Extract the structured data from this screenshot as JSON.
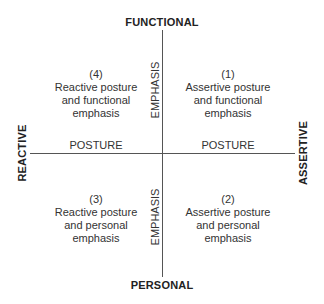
{
  "diagram": {
    "poles": {
      "top": "FUNCTIONAL",
      "bottom": "PERSONAL",
      "left": "REACTIVE",
      "right": "ASSERTIVE"
    },
    "axes": {
      "horizontal_label_left": "POSTURE",
      "horizontal_label_right": "POSTURE",
      "vertical_label_top": "EMPHASIS",
      "vertical_label_bottom": "EMPHASIS"
    },
    "quadrants": {
      "q1": {
        "number": "(1)",
        "line1": "Assertive posture",
        "line2": "and functional",
        "line3": "emphasis"
      },
      "q2": {
        "number": "(2)",
        "line1": "Assertive posture",
        "line2": "and personal",
        "line3": "emphasis"
      },
      "q3": {
        "number": "(3)",
        "line1": "Reactive posture",
        "line2": "and personal",
        "line3": "emphasis"
      },
      "q4": {
        "number": "(4)",
        "line1": "Reactive posture",
        "line2": "and functional",
        "line3": "emphasis"
      }
    },
    "colors": {
      "axis_line": "#555555",
      "pole_text": "#222222",
      "body_text": "#333333",
      "background": "#ffffff"
    }
  }
}
